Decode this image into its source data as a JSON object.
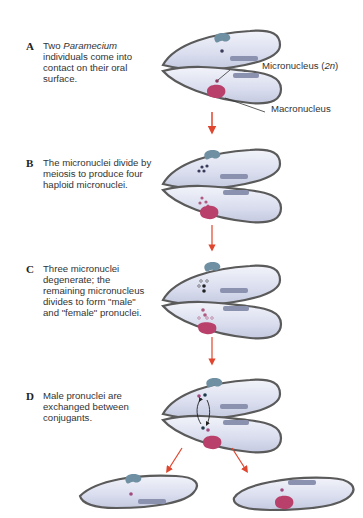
{
  "steps": [
    {
      "letter": "A",
      "text_pre": "Two ",
      "text_italic": "Paramecium",
      "text_post": " individuals come into contact on their oral surface."
    },
    {
      "letter": "B",
      "text": "The micronuclei divide by meiosis to produce four haploid micronuclei."
    },
    {
      "letter": "C",
      "text": "Three micronuclei degenerate; the remaining micronucleus divides to form \"male\" and \"female\" pronuclei."
    },
    {
      "letter": "D",
      "text": "Male pronuclei are exchanged between conjugants."
    }
  ],
  "labels": {
    "micronucleus": "Micronucleus (",
    "micronucleus_ploidy": "2n",
    "micronucleus_close": ")",
    "macronucleus": "Macronucleus"
  },
  "colors": {
    "cell_fill": "#dfe2f0",
    "cell_outline": "#555555",
    "macronucleus_top": "#6f8fa3",
    "macronucleus_bottom": "#b8406a",
    "arrow": "#e0452e"
  }
}
